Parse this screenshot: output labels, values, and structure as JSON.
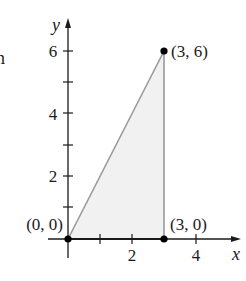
{
  "figure": {
    "partial_text_left": "n",
    "axes": {
      "x_label": "x",
      "y_label": "y",
      "x_ticks": [
        1,
        2,
        3,
        4
      ],
      "x_tick_labels": [
        "2",
        "4"
      ],
      "y_ticks": [
        1,
        2,
        3,
        4,
        5,
        6
      ],
      "y_tick_labels": [
        "2",
        "4",
        "6"
      ]
    },
    "points": [
      {
        "label": "(0, 0)",
        "x": 0,
        "y": 0
      },
      {
        "label": "(3, 6)",
        "x": 3,
        "y": 6
      },
      {
        "label": "(3, 0)",
        "x": 3,
        "y": 0
      }
    ],
    "region": {
      "shape": "triangle",
      "vertices": [
        [
          0,
          0
        ],
        [
          3,
          6
        ],
        [
          3,
          0
        ]
      ],
      "fill_color": "#f1f1f1",
      "edge_color": "#9a9a9a"
    },
    "colors": {
      "axis": "#1a1a1a",
      "point": "#000000"
    }
  }
}
